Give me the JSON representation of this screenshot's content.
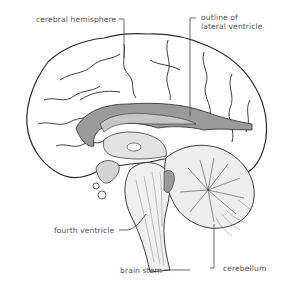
{
  "diagram": {
    "type": "anatomical-illustration",
    "labels": [
      {
        "id": "cerebral-hemisphere",
        "text": "cerebral hemisphere"
      },
      {
        "id": "outline-lateral-ventricle",
        "line1": "outline of",
        "line2": "lateral ventricle"
      },
      {
        "id": "fourth-ventricle",
        "text": "fourth ventricle"
      },
      {
        "id": "brain-stem",
        "text": "brain stem"
      },
      {
        "id": "cerebellum",
        "text": "cerebellum"
      }
    ],
    "colors": {
      "outline": "#2a2a2a",
      "ventricle_shade": "#9a9a9a",
      "label_text": "#555555",
      "background": "#ffffff"
    }
  }
}
